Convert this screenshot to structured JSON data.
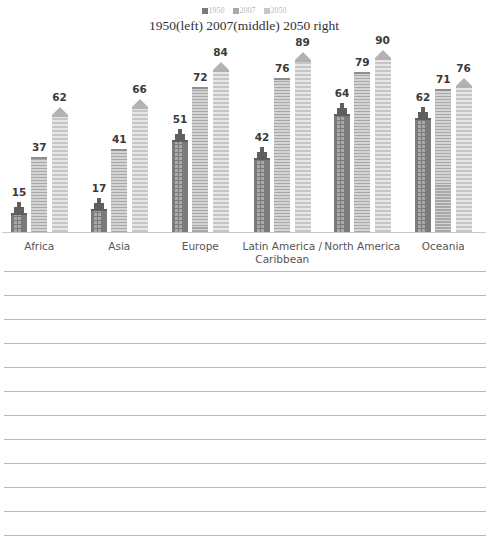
{
  "legend": [
    {
      "label": "1950",
      "color": "#7a7a7a"
    },
    {
      "label": "2007",
      "color": "#a8a8a8"
    },
    {
      "label": "2050",
      "color": "#c6c6c6"
    }
  ],
  "title": "1950(left) 2007(middle) 2050 right",
  "categories_display": [
    "Africa",
    "Asia",
    "Europe",
    "Latin America / Caribbean",
    "North America",
    "Oceania"
  ],
  "chart_data": {
    "type": "bar",
    "title": "1950(left) 2007(middle) 2050 right",
    "xlabel": "",
    "ylabel": "",
    "categories": [
      "Africa",
      "Asia",
      "Europe",
      "Latin America / Caribbean",
      "North America",
      "Oceania"
    ],
    "series": [
      {
        "name": "1950",
        "values": [
          15,
          17,
          51,
          42,
          64,
          62
        ]
      },
      {
        "name": "2007",
        "values": [
          37,
          41,
          72,
          76,
          79,
          71
        ]
      },
      {
        "name": "2050",
        "values": [
          62,
          66,
          84,
          89,
          90,
          76
        ]
      }
    ],
    "ylim": [
      0,
      100
    ],
    "grid": false,
    "legend_position": "top",
    "style": "building pictogram bars with data labels"
  },
  "ruled_lines_count": 12
}
